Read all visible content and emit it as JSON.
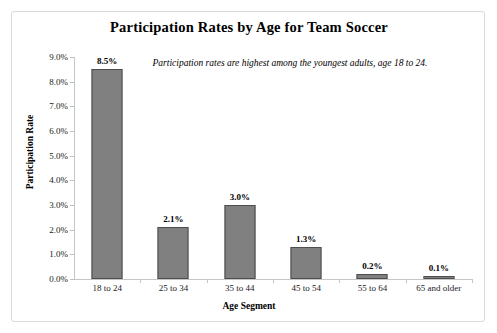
{
  "chart_data": {
    "type": "bar",
    "title": "Participation Rates by Age for Team Soccer",
    "xlabel": "Age Segment",
    "ylabel": "Participation Rate",
    "categories": [
      "18 to 24",
      "25 to 34",
      "35 to 44",
      "45 to 54",
      "55 to 64",
      "65 and older"
    ],
    "values": [
      8.5,
      2.1,
      3.0,
      1.3,
      0.2,
      0.1
    ],
    "value_labels": [
      "8.5%",
      "2.1%",
      "3.0%",
      "1.3%",
      "0.2%",
      "0.1%"
    ],
    "ylim": [
      0,
      9
    ],
    "ytick_labels": [
      "0.0%",
      "1.0%",
      "2.0%",
      "3.0%",
      "4.0%",
      "5.0%",
      "6.0%",
      "7.0%",
      "8.0%",
      "9.0%"
    ],
    "ytick_values": [
      0,
      1,
      2,
      3,
      4,
      5,
      6,
      7,
      8,
      9
    ],
    "grid": false,
    "legend": "none",
    "annotations": [
      "Participation rates are highest among the youngest adults, age 18 to 24."
    ],
    "colors": {
      "bar_fill": "#808080",
      "bar_border": "#4d4d4d",
      "axis": "#c6c6c6",
      "frame": "#d9d9d9",
      "background": "#ffffff",
      "text": "#000000"
    }
  }
}
